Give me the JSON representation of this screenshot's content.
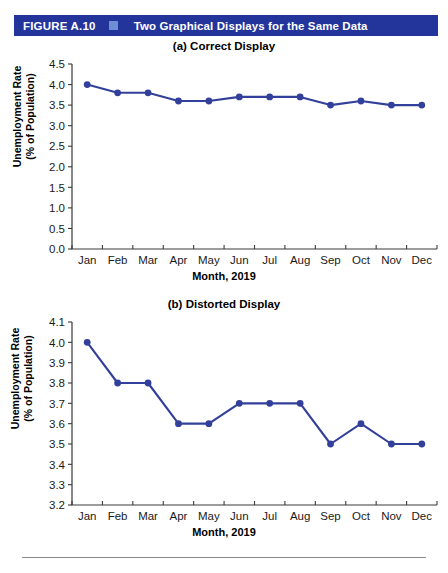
{
  "header": {
    "figure_number": "FIGURE A.10",
    "marker_icon": "square-marker",
    "title": "Two Graphical Displays for the Same Data",
    "bar_color": "#23359B",
    "marker_color": "#6E8FD6",
    "text_color": "#FFFFFF"
  },
  "chart_data": [
    {
      "type": "line",
      "panel": "a",
      "title": "(a) Correct Display",
      "xlabel": "Month, 2019",
      "ylabel": "Unemployment Rate\n(% of Population)",
      "categories": [
        "Jan",
        "Feb",
        "Mar",
        "Apr",
        "May",
        "Jun",
        "Jul",
        "Aug",
        "Sep",
        "Oct",
        "Nov",
        "Dec"
      ],
      "values": [
        4.0,
        3.8,
        3.8,
        3.6,
        3.6,
        3.7,
        3.7,
        3.7,
        3.5,
        3.6,
        3.5,
        3.5
      ],
      "ylim": [
        0.0,
        4.5
      ],
      "ytick_step": 0.5,
      "yticks": [
        "0.0",
        "0.5",
        "1.0",
        "1.5",
        "2.0",
        "2.5",
        "3.0",
        "3.5",
        "4.0",
        "4.5"
      ],
      "grid": false,
      "legend": "none",
      "series_color": "#33409B"
    },
    {
      "type": "line",
      "panel": "b",
      "title": "(b) Distorted Display",
      "xlabel": "Month, 2019",
      "ylabel": "Unemployment Rate\n(% of Population)",
      "categories": [
        "Jan",
        "Feb",
        "Mar",
        "Apr",
        "May",
        "Jun",
        "Jul",
        "Aug",
        "Sep",
        "Oct",
        "Nov",
        "Dec"
      ],
      "values": [
        4.0,
        3.8,
        3.8,
        3.6,
        3.6,
        3.7,
        3.7,
        3.7,
        3.5,
        3.6,
        3.5,
        3.5
      ],
      "ylim": [
        3.2,
        4.1
      ],
      "ytick_step": 0.1,
      "yticks": [
        "3.2",
        "3.3",
        "3.4",
        "3.5",
        "3.6",
        "3.7",
        "3.8",
        "3.9",
        "4.0",
        "4.1"
      ],
      "grid": false,
      "legend": "none",
      "series_color": "#33409B"
    }
  ]
}
